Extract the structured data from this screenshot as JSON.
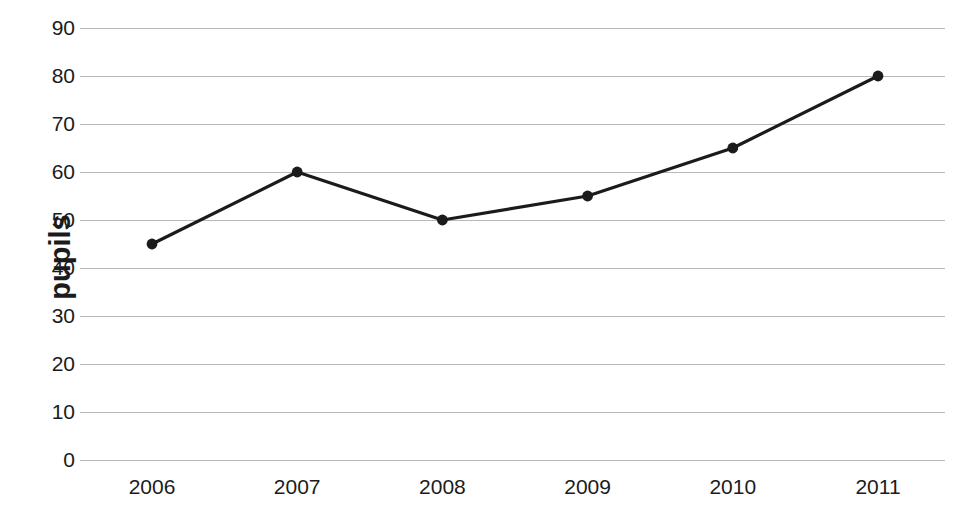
{
  "chart_data": {
    "type": "line",
    "title": "",
    "subtitle": "",
    "xlabel": "",
    "ylabel": "pupils",
    "categories": [
      "2006",
      "2007",
      "2008",
      "2009",
      "2010",
      "2011"
    ],
    "x": [
      2006,
      2007,
      2008,
      2009,
      2010,
      2011
    ],
    "values": [
      45,
      60,
      50,
      55,
      65,
      80
    ],
    "series": [
      {
        "name": "pupils",
        "values": [
          45,
          60,
          50,
          55,
          65,
          80
        ]
      }
    ],
    "ylim": [
      0,
      90
    ],
    "yticks": [
      0,
      10,
      20,
      30,
      40,
      50,
      60,
      70,
      80,
      90
    ],
    "ytick_labels": [
      "0",
      "10",
      "20",
      "30",
      "40",
      "50",
      "60",
      "70",
      "80",
      "90"
    ],
    "xtick_labels": [
      "2006",
      "2007",
      "2008",
      "2009",
      "2010",
      "2011"
    ],
    "grid": true,
    "grid_axis": "y",
    "legend": false,
    "legend_position": "none",
    "annotations": [],
    "colors": {
      "line": "#1b1b1b",
      "marker": "#1b1b1b",
      "grid": "#b9b9b9",
      "text": "#1b1b1b",
      "background": "#ffffff"
    }
  }
}
